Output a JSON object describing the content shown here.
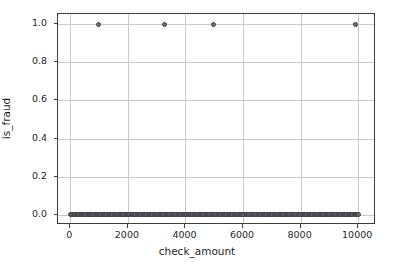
{
  "chart_data": {
    "type": "scatter",
    "title": "",
    "xlabel": "check_amount",
    "ylabel": "is_fraud",
    "xlim": [
      -430,
      10620
    ],
    "ylim": [
      -0.055,
      1.055
    ],
    "grid": true,
    "legend": null,
    "xticks": [
      0,
      2000,
      4000,
      6000,
      8000,
      10000
    ],
    "xticklabels": [
      "0",
      "2000",
      "4000",
      "6000",
      "8000",
      "10000"
    ],
    "yticks": [
      0.0,
      0.2,
      0.4,
      0.6,
      0.8,
      1.0
    ],
    "yticklabels": [
      "0.0",
      "0.2",
      "0.4",
      "0.6",
      "0.8",
      "1.0"
    ],
    "marker_face_color": "#6e6e7a",
    "marker_edge_color": "#3f3f46",
    "series": [
      {
        "name": "observations",
        "x": [
          20,
          55,
          95,
          130,
          170,
          215,
          250,
          290,
          335,
          370,
          410,
          455,
          495,
          540,
          580,
          615,
          655,
          700,
          740,
          780,
          820,
          865,
          905,
          950,
          980,
          1020,
          1060,
          1105,
          1145,
          1185,
          1230,
          1270,
          1315,
          1355,
          1395,
          1440,
          1480,
          1520,
          1565,
          1605,
          1650,
          1690,
          1735,
          1775,
          1815,
          1860,
          1900,
          1945,
          1985,
          2025,
          2070,
          2110,
          2155,
          2195,
          2240,
          2280,
          2320,
          2365,
          2405,
          2450,
          2490,
          2530,
          2575,
          2615,
          2660,
          2700,
          2745,
          2785,
          2825,
          2870,
          2910,
          2955,
          2995,
          3035,
          3080,
          3120,
          3165,
          3205,
          3250,
          3290,
          3330,
          3375,
          3415,
          3460,
          3500,
          3545,
          3585,
          3625,
          3670,
          3710,
          3755,
          3795,
          3840,
          3880,
          3920,
          3965,
          4005,
          4050,
          4090,
          4130,
          4175,
          4215,
          4260,
          4300,
          4345,
          4385,
          4425,
          4470,
          4510,
          4555,
          4595,
          4640,
          4680,
          4720,
          4765,
          4805,
          4850,
          4890,
          4930,
          4975,
          5015,
          5060,
          5100,
          5145,
          5185,
          5225,
          5270,
          5310,
          5355,
          5395,
          5440,
          5480,
          5520,
          5565,
          5605,
          5650,
          5690,
          5730,
          5775,
          5815,
          5860,
          5900,
          5945,
          5985,
          6025,
          6070,
          6110,
          6155,
          6195,
          6240,
          6280,
          6320,
          6365,
          6405,
          6450,
          6490,
          6530,
          6575,
          6615,
          6660,
          6700,
          6745,
          6785,
          6825,
          6870,
          6910,
          6955,
          6995,
          7040,
          7080,
          7120,
          7165,
          7205,
          7250,
          7290,
          7330,
          7375,
          7415,
          7460,
          7500,
          7545,
          7585,
          7625,
          7670,
          7710,
          7755,
          7795,
          7840,
          7880,
          7920,
          7965,
          8005,
          8050,
          8090,
          8130,
          8175,
          8215,
          8260,
          8300,
          8345,
          8385,
          8425,
          8470,
          8510,
          8555,
          8595,
          8640,
          8680,
          8720,
          8765,
          8805,
          8850,
          8890,
          8930,
          8975,
          9015,
          9060,
          9100,
          9145,
          9185,
          9225,
          9270,
          9310,
          9355,
          9395,
          9440,
          9480,
          9520,
          9565,
          9605,
          9650,
          9690,
          9730,
          9775,
          9815,
          9860,
          9900,
          9945,
          9985,
          10010
        ],
        "y": [
          0,
          0,
          0,
          0,
          0,
          0,
          0,
          0,
          0,
          0,
          0,
          0,
          0,
          0,
          0,
          0,
          0,
          0,
          0,
          0,
          0,
          0,
          0,
          0,
          0,
          0,
          0,
          0,
          0,
          0,
          0,
          0,
          0,
          0,
          0,
          0,
          0,
          0,
          0,
          0,
          0,
          0,
          0,
          0,
          0,
          0,
          0,
          0,
          0,
          0,
          0,
          0,
          0,
          0,
          0,
          0,
          0,
          0,
          0,
          0,
          0,
          0,
          0,
          0,
          0,
          0,
          0,
          0,
          0,
          0,
          0,
          0,
          0,
          0,
          0,
          0,
          0,
          0,
          0,
          0,
          0,
          0,
          0,
          0,
          0,
          0,
          0,
          0,
          0,
          0,
          0,
          0,
          0,
          0,
          0,
          0,
          0,
          0,
          0,
          0,
          0,
          0,
          0,
          0,
          0,
          0,
          0,
          0,
          0,
          0,
          0,
          0,
          0,
          0,
          0,
          0,
          0,
          0,
          0,
          0,
          0,
          0,
          0,
          0,
          0,
          0,
          0,
          0,
          0,
          0,
          0,
          0,
          0,
          0,
          0,
          0,
          0,
          0,
          0,
          0,
          0,
          0,
          0,
          0,
          0,
          0,
          0,
          0,
          0,
          0,
          0,
          0,
          0,
          0,
          0,
          0,
          0,
          0,
          0,
          0,
          0,
          0,
          0,
          0,
          0,
          0,
          0,
          0,
          0,
          0,
          0,
          0,
          0,
          0,
          0,
          0,
          0,
          0,
          0,
          0,
          0,
          0,
          0,
          0,
          0,
          0,
          0,
          0,
          0,
          0,
          0,
          0,
          0,
          0,
          0,
          0,
          0,
          0,
          0,
          0,
          0,
          0,
          0,
          0,
          0,
          0,
          0,
          0,
          0,
          0,
          0,
          0,
          0,
          0,
          0,
          0,
          0,
          0,
          0,
          0,
          0,
          0,
          0,
          0,
          0,
          0,
          0,
          0,
          0,
          0,
          0,
          0,
          0,
          0,
          0,
          0,
          0,
          0,
          0,
          0
        ]
      },
      {
        "name": "fraud-points",
        "x": [
          980,
          3270,
          4990,
          9900
        ],
        "y": [
          1,
          1,
          1,
          1
        ]
      }
    ]
  }
}
